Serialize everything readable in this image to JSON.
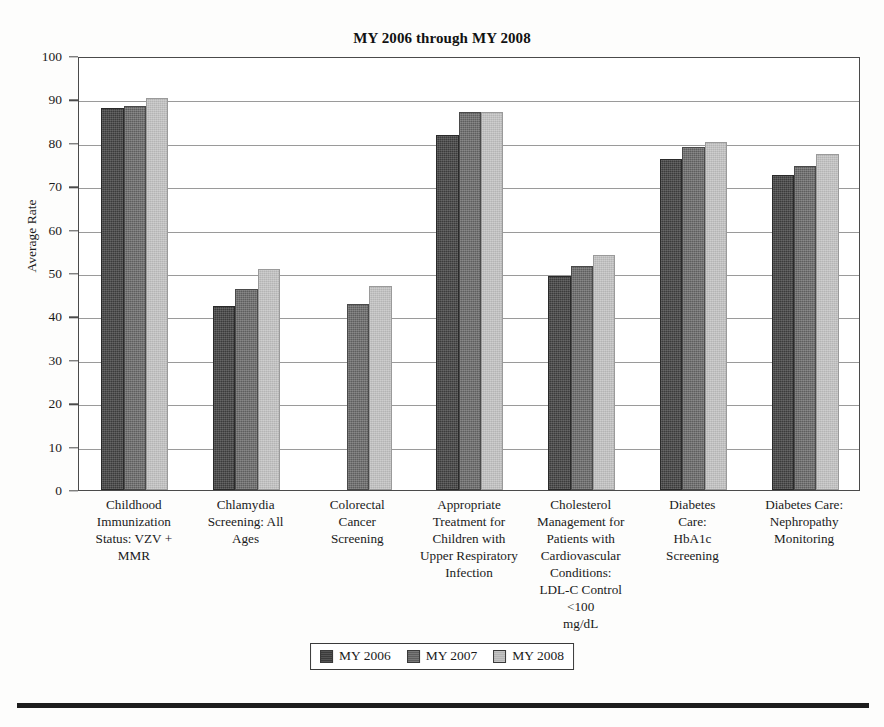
{
  "chart_data": {
    "type": "bar",
    "title": "MY 2006 through MY 2008",
    "xlabel": "",
    "ylabel": "Average Rate",
    "ylim": [
      0,
      100
    ],
    "ytick_step": 10,
    "yticks": [
      100,
      90,
      80,
      70,
      60,
      50,
      40,
      30,
      20,
      10,
      0
    ],
    "grid": true,
    "legend_position": "bottom-center",
    "categories": [
      "Childhood Immunization Status: VZV + MMR",
      "Chlamydia Screening: All Ages",
      "Colorectal Cancer Screening",
      "Appropriate Treatment for Children with Upper Respiratory Infection",
      "Cholesterol Management for Patients with Cardiovascular Conditions: LDL-C Control <100 mg/dL",
      "Diabetes Care: HbA1c Screening",
      "Diabetes Care: Nephropathy Monitoring"
    ],
    "category_lines": [
      [
        "Childhood",
        "Immunization",
        "Status: VZV +",
        "MMR"
      ],
      [
        "Chlamydia",
        "Screening: All",
        "Ages"
      ],
      [
        "Colorectal",
        "Cancer",
        "Screening"
      ],
      [
        "Appropriate",
        "Treatment for",
        "Children with",
        "Upper Respiratory",
        "Infection"
      ],
      [
        "Cholesterol",
        "Management for",
        "Patients with",
        "Cardiovascular",
        "Conditions:",
        "LDL-C Control <100",
        "mg/dL"
      ],
      [
        "Diabetes",
        "Care:",
        "HbA1c",
        "Screening"
      ],
      [
        "Diabetes Care:",
        "Nephropathy",
        "Monitoring"
      ]
    ],
    "series": [
      {
        "name": "MY 2006",
        "color": "#3b3b3b",
        "values": [
          88.0,
          42.5,
          null,
          81.8,
          49.4,
          76.3,
          72.6
        ]
      },
      {
        "name": "MY 2007",
        "color": "#5e5e5e",
        "values": [
          88.4,
          46.3,
          42.9,
          87.0,
          51.6,
          79.0,
          74.7
        ]
      },
      {
        "name": "MY 2008",
        "color": "#b4b4b4",
        "values": [
          90.3,
          51.0,
          47.0,
          87.1,
          54.2,
          80.2,
          77.4
        ]
      }
    ]
  },
  "legend": {
    "items": [
      {
        "label": "MY 2006"
      },
      {
        "label": "MY 2007"
      },
      {
        "label": "MY 2008"
      }
    ]
  }
}
